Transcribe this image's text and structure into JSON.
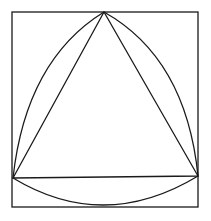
{
  "diagram": {
    "stroke_color": "#1a1a1a",
    "background": "#ffffff",
    "square": {
      "x": 12,
      "y": 12,
      "width": 186,
      "height": 195
    },
    "triangle": {
      "apex": [
        104,
        12
      ],
      "left": [
        13,
        178
      ],
      "right": [
        198,
        176
      ]
    },
    "arcs": [
      "left-arc",
      "right-arc",
      "bottom-arc"
    ]
  }
}
